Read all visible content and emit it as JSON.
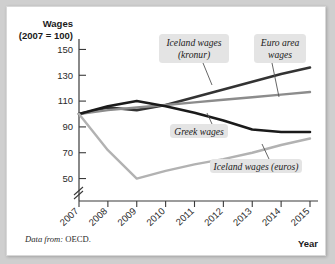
{
  "figure": {
    "source_note_lead": "Data from:",
    "source_note_value": "OECD."
  },
  "chart_data": {
    "type": "line",
    "title": "",
    "ylabel_line1": "Wages",
    "ylabel_line2": "(2007 = 100)",
    "xlabel": "Year",
    "categories": [
      "2007",
      "2008",
      "2009",
      "2010",
      "2011",
      "2012",
      "2013",
      "2014",
      "2015"
    ],
    "x": [
      2007,
      2008,
      2009,
      2010,
      2011,
      2012,
      2013,
      2014,
      2015
    ],
    "xlim": [
      2007,
      2015
    ],
    "ylim": [
      45,
      155
    ],
    "yticks": [
      50,
      70,
      90,
      110,
      130,
      150
    ],
    "ytick_labels": [
      "50",
      "70",
      "90",
      "110",
      "130",
      "150"
    ],
    "axis_break": true,
    "grid": false,
    "legend_position": "inline-callouts",
    "series": [
      {
        "name": "Iceland wages (kronur)",
        "color": "#333333",
        "width": 2.6,
        "values": [
          100,
          105,
          103,
          107,
          113,
          119,
          125,
          131,
          136
        ]
      },
      {
        "name": "Euro area wages",
        "color": "#8c8c8c",
        "width": 2.4,
        "values": [
          100,
          103,
          105,
          107,
          109,
          111,
          113,
          115,
          117
        ]
      },
      {
        "name": "Greek wages",
        "color": "#1a1a1a",
        "width": 2.6,
        "values": [
          100,
          106,
          110,
          106,
          101,
          95,
          88,
          86,
          86
        ]
      },
      {
        "name": "Iceland wages (euros)",
        "color": "#b2b2b2",
        "width": 2.4,
        "values": [
          100,
          72,
          50,
          56,
          61,
          65,
          70,
          76,
          81
        ]
      }
    ],
    "annotations": [
      {
        "label": "Iceland wages (kronur)",
        "lines": [
          "Iceland wages",
          "(kronur)"
        ],
        "box": {
          "x": 152,
          "y": 27,
          "w": 70,
          "h": 29
        },
        "leader": {
          "x1": 196,
          "y1": 56,
          "x2": 205,
          "y2": 78
        }
      },
      {
        "label": "Euro area wages",
        "lines": [
          "Euro area",
          "wages"
        ],
        "box": {
          "x": 247,
          "y": 27,
          "w": 52,
          "h": 29
        },
        "leader": {
          "x1": 265,
          "y1": 56,
          "x2": 272,
          "y2": 90
        }
      },
      {
        "label": "Greek wages",
        "lines": [
          "Greek wages"
        ],
        "box": {
          "x": 163,
          "y": 117,
          "w": 58,
          "h": 14
        },
        "leader": {
          "x1": 205,
          "y1": 117,
          "x2": 200,
          "y2": 106
        }
      },
      {
        "label": "Iceland wages (euros)",
        "lines": [
          "Iceland wages (euros)"
        ],
        "box": {
          "x": 203,
          "y": 152,
          "w": 92,
          "h": 14
        },
        "leader": {
          "x1": 262,
          "y1": 152,
          "x2": 255,
          "y2": 137
        }
      }
    ]
  }
}
